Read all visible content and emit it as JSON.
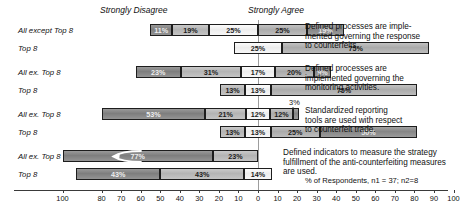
{
  "header": {
    "left_anchor": "Strongly Disagree",
    "right_anchor": "Strongly Agree"
  },
  "footnote": "% of Respondents, n1 = 37; n2=8",
  "axis": {
    "ticks": [
      100,
      80,
      70,
      60,
      50,
      40,
      30,
      20,
      10,
      0,
      10,
      20,
      30,
      40,
      50,
      60,
      70,
      80,
      90,
      100
    ],
    "left_max": 100,
    "right_max": 100,
    "center_value": 0
  },
  "row_labels": {
    "all_except_long": "All except Top 8",
    "all_except_short": "All ex. Top 8",
    "top8": "Top 8"
  },
  "chart_data": {
    "type": "bar",
    "subtype": "diverging-stacked-likert",
    "title": "",
    "xlabel": "% of Respondents, n1 = 37; n2=8",
    "ylabel": "",
    "xlim": [
      -100,
      100
    ],
    "grid": false,
    "legend_position": "top-anchors",
    "legend": [
      "Strongly Disagree",
      "Strongly Agree"
    ],
    "groups": [
      {
        "statement": "Defined processes are imple-\nmented governing the response\nto counterfeits.",
        "rows": [
          {
            "label": "All except Top 8",
            "n": 37,
            "values": [
              11,
              19,
              25,
              25,
              19
            ],
            "labels": [
              "11%",
              "19%",
              "25%",
              "25%",
              "19%"
            ],
            "left_extent": 55
          },
          {
            "label": "Top 8",
            "n": 8,
            "values": [
              0,
              0,
              25,
              75,
              0
            ],
            "labels": [
              "",
              "",
              "25%",
              "75%",
              ""
            ],
            "left_extent": 12.5
          }
        ]
      },
      {
        "statement": "Defined processes are\nimplemented governing the\nmonitoring activities.",
        "rows": [
          {
            "label": "All ex. Top 8",
            "n": 37,
            "values": [
              23,
              31,
              17,
              20,
              9
            ],
            "labels": [
              "23%",
              "31%",
              "17%",
              "20%",
              "9%"
            ],
            "left_extent": 62.5
          },
          {
            "label": "Top 8",
            "n": 8,
            "values": [
              0,
              13,
              13,
              75,
              0
            ],
            "labels": [
              "",
              "13%",
              "13%",
              "75%",
              ""
            ],
            "left_extent": 19.5
          }
        ]
      },
      {
        "statement": "Standardized reporting\ntools are used with respect\nto counterfeit trade.",
        "rows": [
          {
            "label": "All ex. Top 8",
            "n": 37,
            "values": [
              53,
              21,
              12,
              12,
              3
            ],
            "labels": [
              "53%",
              "21%",
              "12%",
              "12%",
              ""
            ],
            "left_extent": 80,
            "annotation": "3%"
          },
          {
            "label": "Top 8",
            "n": 8,
            "values": [
              0,
              13,
              13,
              25,
              50
            ],
            "labels": [
              "",
              "13%",
              "13%",
              "25%",
              "50%"
            ],
            "left_extent": 19.5
          }
        ]
      },
      {
        "statement": "Defined indicators to measure the strategy\nfulfillment of the anti-counterfeiting measures\nare used.",
        "rows": [
          {
            "label": "All ex. Top 8",
            "n": 37,
            "values": [
              77,
              23,
              0,
              0,
              0
            ],
            "labels": [
              "77%",
              "23%",
              "",
              "",
              ""
            ],
            "left_extent": 100,
            "has_arrow": true
          },
          {
            "label": "Top 8",
            "n": 8,
            "values": [
              43,
              43,
              14,
              0,
              0
            ],
            "labels": [
              "43%",
              "43%",
              "14%",
              "",
              ""
            ],
            "left_extent": 93
          }
        ]
      }
    ]
  }
}
